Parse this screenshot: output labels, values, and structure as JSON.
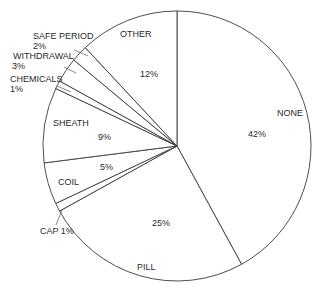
{
  "chart_data": {
    "type": "pie",
    "title": "",
    "start_angle_deg": 0,
    "direction": "clockwise",
    "categories": [
      "NONE",
      "PILL",
      "CAP",
      "COIL",
      "SHEATH",
      "CHEMICALS",
      "WITHDRAWAL",
      "SAFE PERIOD",
      "OTHER"
    ],
    "values": [
      42,
      25,
      1,
      5,
      9,
      1,
      3,
      2,
      12
    ],
    "unit": "%",
    "legend": "none (labels placed on/next to slices)",
    "slices": [
      {
        "name": "NONE",
        "value": 42,
        "pct_label": "42%"
      },
      {
        "name": "PILL",
        "value": 25,
        "pct_label": "25%"
      },
      {
        "name": "CAP",
        "value": 1,
        "pct_label": "1%"
      },
      {
        "name": "COIL",
        "value": 5,
        "pct_label": "5%"
      },
      {
        "name": "SHEATH",
        "value": 9,
        "pct_label": "9%"
      },
      {
        "name": "CHEMICALS",
        "value": 1,
        "pct_label": "1%"
      },
      {
        "name": "WITHDRAWAL",
        "value": 3,
        "pct_label": "3%"
      },
      {
        "name": "SAFE PERIOD",
        "value": 2,
        "pct_label": "2%"
      },
      {
        "name": "OTHER",
        "value": 12,
        "pct_label": "12%"
      }
    ],
    "colors": {
      "fill": "#ffffff",
      "stroke": "#3a3a3a",
      "text": "#2a2a2a"
    }
  },
  "labels": {
    "none_name": "NONE",
    "none_pct": "42%",
    "pill_name": "PILL",
    "pill_pct": "25%",
    "cap": "CAP 1%",
    "coil_name": "COIL",
    "coil_pct": "5%",
    "sheath_name": "SHEATH",
    "sheath_pct": "9%",
    "chemicals_name": "CHEMICALS",
    "chemicals_pct": "1%",
    "withdrawal_name": "WITHDRAWAL",
    "withdrawal_pct": "3%",
    "safe_period_name": "SAFE PERIOD",
    "safe_period_pct": "2%",
    "other_name": "OTHER",
    "other_pct": "12%"
  }
}
